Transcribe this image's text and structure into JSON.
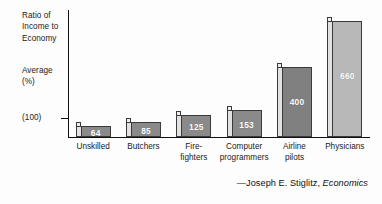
{
  "axis": {
    "title_lines": [
      "Ratio of",
      "Income to",
      "Economy"
    ],
    "subtitle_lines": [
      "Average",
      "(%)"
    ],
    "baseline_label": "(100)"
  },
  "attribution": {
    "dash_author": "—Joseph E. Stiglitz,",
    "work": "Economics"
  },
  "chart_data": {
    "type": "bar",
    "title": "",
    "xlabel": "",
    "ylabel": "Ratio of Income to Economy Average (%)",
    "ylim": [
      0,
      700
    ],
    "grid": false,
    "legend": "none",
    "reference_line": 100,
    "reference_line_label": "(100)",
    "categories": [
      "Unskilled",
      "Butchers",
      "Fire-fighters",
      "Computer programmers",
      "Airline pilots",
      "Physicians"
    ],
    "category_label_lines": [
      [
        "Unskilled"
      ],
      [
        "Butchers"
      ],
      [
        "Fire-",
        "fighters"
      ],
      [
        "Computer",
        "programmers"
      ],
      [
        "Airline",
        "pilots"
      ],
      [
        "Physicians"
      ]
    ],
    "values": [
      64,
      85,
      125,
      153,
      400,
      660
    ],
    "value_labels": [
      "64",
      "85",
      "125",
      "153",
      "400",
      "660"
    ],
    "bar_colors": [
      "#8a8a8a",
      "#8a8a8a",
      "#8a8a8a",
      "#8a8a8a",
      "#808080",
      "#b8b8b8"
    ],
    "bar_side_color": "#e2e2e2",
    "bar_outline_color": "#3a3a3a",
    "value_label_color": "#ffffff"
  }
}
